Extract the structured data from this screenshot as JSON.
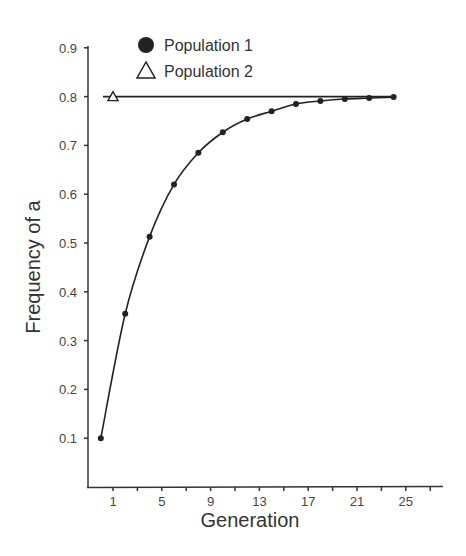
{
  "chart_data": {
    "type": "line",
    "title": "",
    "xlabel": "Generation",
    "ylabel": "Frequency of a",
    "xlim": [
      -0.8,
      28.2
    ],
    "ylim": [
      0.0,
      0.9
    ],
    "x_ticks": [
      1,
      3,
      5,
      7,
      9,
      11,
      13,
      15,
      17,
      19,
      21,
      23,
      25,
      27
    ],
    "x_tick_labels": [
      "1",
      "",
      "5",
      "",
      "9",
      "",
      "13",
      "",
      "17",
      "",
      "21",
      "",
      "25",
      ""
    ],
    "y_ticks": [
      0.1,
      0.2,
      0.3,
      0.4,
      0.5,
      0.6,
      0.7,
      0.8,
      0.9
    ],
    "y_tick_labels": [
      "0.1",
      "0.2",
      "0.3",
      "0.4",
      "0.5",
      "0.6",
      "0.7",
      "0.8",
      "0.9"
    ],
    "grid": false,
    "legend_position": "top-left",
    "series": [
      {
        "name": "Population 1",
        "marker": "filled-circle",
        "color": "#222222",
        "x": [
          0,
          2,
          4,
          6,
          8,
          10,
          12,
          14,
          16,
          18,
          20,
          22,
          24
        ],
        "values": [
          0.1,
          0.355,
          0.513,
          0.62,
          0.685,
          0.727,
          0.754,
          0.77,
          0.785,
          0.791,
          0.795,
          0.797,
          0.799
        ]
      },
      {
        "name": "Population 2",
        "marker": "open-triangle",
        "color": "#222222",
        "x": [
          0,
          24
        ],
        "values": [
          0.8,
          0.8
        ],
        "marker_at": [
          1,
          0.8
        ]
      }
    ]
  }
}
